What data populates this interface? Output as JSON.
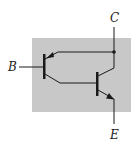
{
  "diagram": {
    "type": "transistor-pair-circuit",
    "terminals": {
      "collector": "C",
      "base": "B",
      "emitter": "E"
    },
    "colors": {
      "background": "#ffffff",
      "box_fill": "#c8c8c8",
      "line": "#1a1a1a"
    }
  }
}
